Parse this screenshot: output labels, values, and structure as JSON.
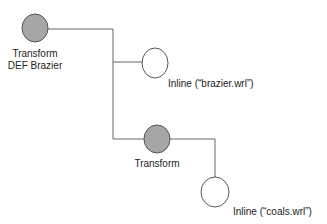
{
  "diagram": {
    "type": "scene-graph",
    "nodes": [
      {
        "id": "transform-brazier",
        "kind": "grouping",
        "label_lines": [
          "Transform",
          "DEF Brazier"
        ]
      },
      {
        "id": "inline-brazier",
        "kind": "leaf",
        "label": "Inline (“brazier.wrl”)"
      },
      {
        "id": "transform-coals",
        "kind": "grouping",
        "label": "Transform"
      },
      {
        "id": "inline-coals",
        "kind": "leaf",
        "label": "Inline (“coals.wrl”)"
      }
    ],
    "edges": [
      {
        "from": "transform-brazier",
        "to": "inline-brazier"
      },
      {
        "from": "transform-brazier",
        "to": "transform-coals"
      },
      {
        "from": "transform-coals",
        "to": "inline-coals"
      }
    ],
    "colors": {
      "grouping_fill": "#a6a6a6",
      "leaf_fill": "#ffffff",
      "stroke": "#555555"
    }
  }
}
